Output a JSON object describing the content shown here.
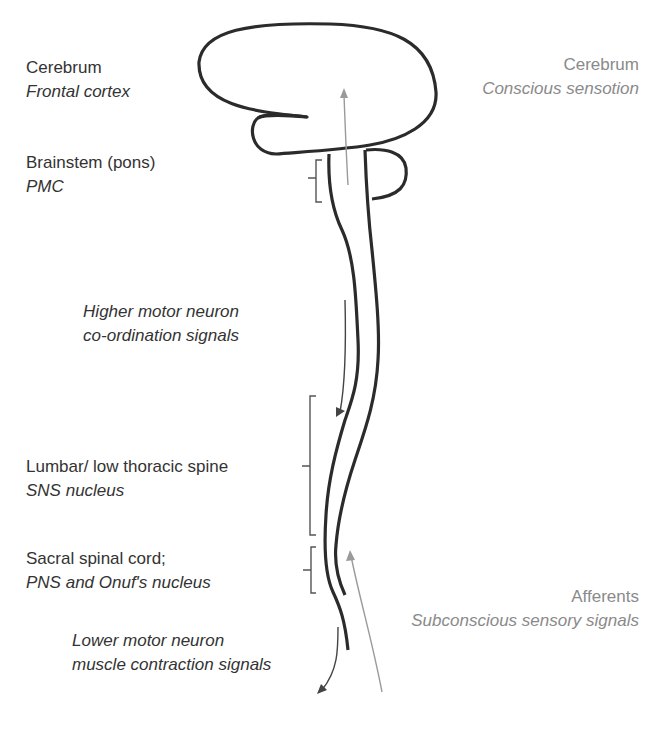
{
  "diagram": {
    "left_labels": [
      {
        "title": "Cerebrum",
        "subtitle": "Frontal cortex"
      },
      {
        "title": "Brainstem (pons)",
        "subtitle": "PMC"
      },
      {
        "title": "Lumbar/ low thoracic spine",
        "subtitle": "SNS nucleus"
      },
      {
        "title": "Sacral spinal cord;",
        "subtitle": "PNS and Onuf's nucleus"
      }
    ],
    "signal_labels": {
      "higher_motor": {
        "line1": "Higher motor neuron",
        "line2": "co-ordination signals"
      },
      "lower_motor": {
        "line1": "Lower motor neuron",
        "line2": "muscle contraction signals"
      }
    },
    "right_labels": {
      "cerebrum": {
        "title": "Cerebrum",
        "subtitle": "Conscious sensotion"
      },
      "afferents": {
        "title": "Afferents",
        "subtitle": "Subconscious sensory signals"
      }
    },
    "colors": {
      "outline": "#2b2b2b",
      "efferent_arrow": "#444444",
      "afferent_arrow": "#9a9a9a",
      "text_dark": "#333333",
      "text_gray": "#8a8a8a"
    }
  }
}
